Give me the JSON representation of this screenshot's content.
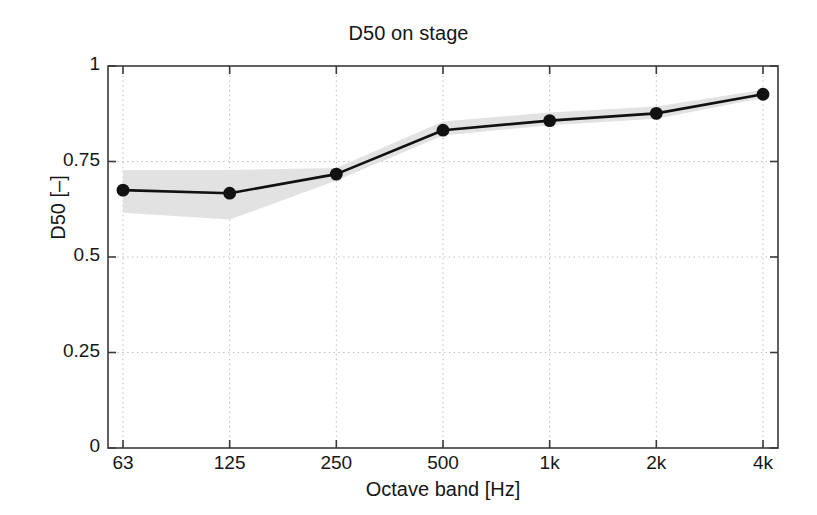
{
  "chart_data": {
    "type": "line",
    "title": "D50 on stage",
    "xlabel": "Octave band [Hz]",
    "ylabel": "D50 [–]",
    "categories": [
      "63",
      "125",
      "250",
      "500",
      "1k",
      "2k",
      "4k"
    ],
    "x_tick_labels": [
      "63",
      "125",
      "250",
      "500",
      "1k",
      "2k",
      "4k"
    ],
    "y_tick_labels": [
      "0",
      "0.25",
      "0.5",
      "0.75",
      "1"
    ],
    "y_tick_values": [
      0,
      0.25,
      0.5,
      0.75,
      1
    ],
    "ylim": [
      0,
      1
    ],
    "grid": true,
    "legend": "none",
    "series": [
      {
        "name": "D50 mean",
        "values": [
          0.675,
          0.667,
          0.717,
          0.832,
          0.857,
          0.876,
          0.926
        ],
        "marker": "circle",
        "color": "#111111"
      }
    ],
    "band": {
      "name": "spread",
      "upper": [
        0.728,
        0.728,
        0.733,
        0.855,
        0.878,
        0.894,
        0.938
      ],
      "lower": [
        0.616,
        0.598,
        0.7,
        0.818,
        0.845,
        0.862,
        0.916
      ],
      "color": "#e2e2e2"
    },
    "colors": {
      "line": "#111111",
      "marker": "#111111",
      "band": "#e2e2e2",
      "axis": "#3a3a3a",
      "grid": "#bbbbbb",
      "background": "#ffffff"
    }
  }
}
